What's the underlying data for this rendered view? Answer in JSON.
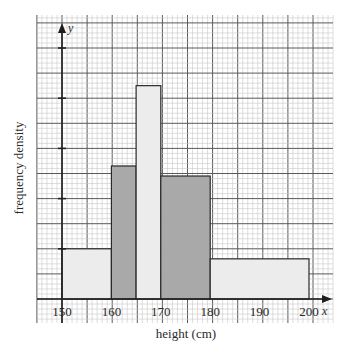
{
  "chart_data": {
    "type": "bar",
    "subtype": "histogram",
    "title": "",
    "xlabel": "height (cm)",
    "ylabel": "frequency density",
    "x_axis_letter": "x",
    "y_axis_letter": "y",
    "x_ticks": [
      150,
      160,
      170,
      180,
      190,
      200
    ],
    "y_ticks_labeled": false,
    "y_unit_note": "heights in major grid squares (no y tick labels shown)",
    "xlim": [
      145,
      205
    ],
    "ylim": [
      0,
      11
    ],
    "grid": true,
    "bins": [
      {
        "from": 150,
        "to": 160,
        "height": 2.0,
        "shade": "light"
      },
      {
        "from": 160,
        "to": 165,
        "height": 5.3,
        "shade": "dark"
      },
      {
        "from": 165,
        "to": 170,
        "height": 8.5,
        "shade": "light"
      },
      {
        "from": 170,
        "to": 180,
        "height": 4.9,
        "shade": "dark"
      },
      {
        "from": 180,
        "to": 200,
        "height": 1.6,
        "shade": "light"
      }
    ],
    "categories": [
      "150-160",
      "160-165",
      "165-170",
      "170-180",
      "180-200"
    ],
    "values": [
      2.0,
      5.3,
      8.5,
      4.9,
      1.6
    ]
  },
  "colors": {
    "light_bar": "#ececec",
    "dark_bar": "#a9a9a9",
    "minor_grid": "#c8c8c8",
    "major_grid": "#5a5a5a",
    "axis": "#1e1e1e",
    "bar_outline": "#2a2a2a"
  }
}
